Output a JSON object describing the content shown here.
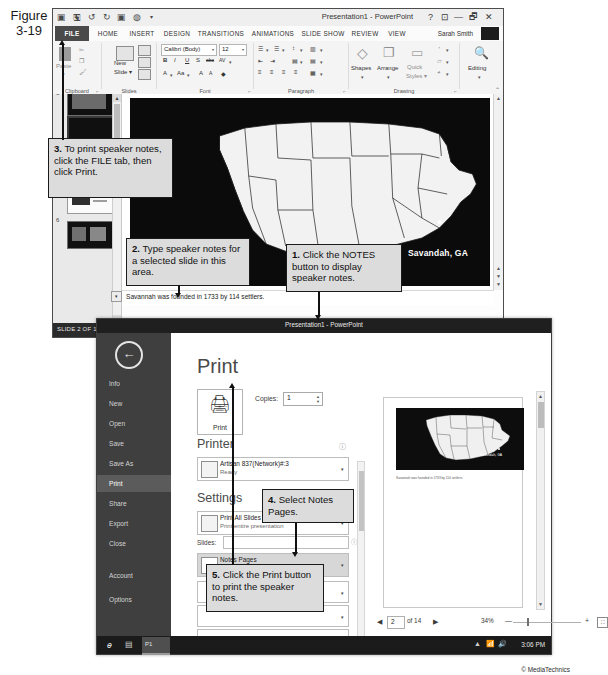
{
  "figure": {
    "line1": "Figure",
    "line2": "3-19"
  },
  "copyright": "© MediaTechnics",
  "ppt_window": {
    "title": "Presentation1 - PowerPoint",
    "quick_access": [
      "save-icon",
      "undo-icon",
      "redo-icon",
      "start-slideshow-icon",
      "customize-icon"
    ],
    "window_buttons": [
      "?",
      "⊡",
      "—",
      "🗗",
      "✕"
    ],
    "tabs": [
      "FILE",
      "HOME",
      "INSERT",
      "DESIGN",
      "TRANSITIONS",
      "ANIMATIONS",
      "SLIDE SHOW",
      "REVIEW",
      "VIEW"
    ],
    "user": "Sarah Smith",
    "ribbon_groups": [
      "Clipboard",
      "Slides",
      "Font",
      "Paragraph",
      "Drawing",
      "Editing"
    ],
    "ribbon": {
      "paste_label": "Paste",
      "new_slide_label": "New\nSlide",
      "font_name": "Calibri (Body)",
      "font_size": "12",
      "bold": "B",
      "italic": "I",
      "underline": "U",
      "shadow": "S",
      "strike": "abc",
      "char_spacing": "AV",
      "font_color": "A",
      "change_case": "Aa",
      "grow_font": "A",
      "shrink_font": "A",
      "clear_format": "◆",
      "shapes_label": "Shapes",
      "arrange_label": "Arrange",
      "quick_styles_label": "Quick\nStyles",
      "editing_label": "Editing"
    },
    "thumbnails": [
      {
        "number": "3",
        "selected": false
      },
      {
        "number": "4",
        "selected": false
      },
      {
        "number": "5",
        "selected": false
      },
      {
        "number": "6",
        "selected": false
      }
    ],
    "slide": {
      "caption": "Savandah, GA"
    },
    "notes": "Savannah was founded in 1733 by 114 settlers.",
    "status": {
      "slide_count": "SLIDE 2 OF 14",
      "language_icon": "language-icon",
      "notes_button": "NOTES",
      "comments_button": "COMMENTS",
      "zoom_percent": "48%",
      "view_buttons": [
        "normal-view-icon",
        "slide-sorter-icon",
        "reading-view-icon",
        "slideshow-icon"
      ]
    }
  },
  "print_window": {
    "title": "Presentation1 - PowerPoint",
    "window_buttons": [
      "?",
      "—",
      "🗗",
      "✕"
    ],
    "user": "Sarah Smith",
    "back_icon": "back-arrow-icon",
    "nav_items": [
      {
        "label": "Info",
        "active": false
      },
      {
        "label": "New",
        "active": false
      },
      {
        "label": "Open",
        "active": false
      },
      {
        "label": "Save",
        "active": false
      },
      {
        "label": "Save As",
        "active": false
      },
      {
        "label": "Print",
        "active": true
      },
      {
        "label": "Share",
        "active": false
      },
      {
        "label": "Export",
        "active": false
      },
      {
        "label": "Close",
        "active": false
      },
      {
        "label": "Account",
        "active": false
      },
      {
        "label": "Options",
        "active": false
      }
    ],
    "heading": "Print",
    "print_button_label": "Print",
    "copies_label": "Copies:",
    "copies_value": "1",
    "printer_heading": "Printer",
    "printer_name": "Artisan 837(Network)#:3",
    "printer_status": "Ready",
    "settings_heading": "Settings",
    "settings": [
      {
        "title": "Print All Slides",
        "subtitle": "Print entire presentation",
        "highlighted": false
      },
      {
        "title": "Notes Pages",
        "subtitle": "Print slides with notes",
        "highlighted": true
      }
    ],
    "slides_label": "Slides:",
    "slides_value": "",
    "preview": {
      "notes_caption": "Savannah was founded in 1733 by 114 settlers.",
      "page_current": "2",
      "page_of": "of 14",
      "zoom_percent": "34%",
      "prev_icon": "previous-page-icon",
      "next_icon": "next-page-icon",
      "fit_icon": "zoom-to-page-icon"
    },
    "taskbar": {
      "ie_icon": "internet-explorer-icon",
      "explorer_icon": "file-explorer-icon",
      "active_app": "P1",
      "clock": "3:06 PM",
      "tray": [
        "show-hidden-icon",
        "network-icon",
        "volume-icon"
      ]
    }
  },
  "callouts": [
    {
      "id": "callout-1",
      "number": "1.",
      "text": " Click the NOTES button to display speaker notes."
    },
    {
      "id": "callout-2",
      "number": "2.",
      "text": " Type speaker notes for a selected slide in this area."
    },
    {
      "id": "callout-3",
      "number": "3.",
      "text": " To print speaker notes, click the FILE tab, then click Print."
    },
    {
      "id": "callout-4",
      "number": "4.",
      "text": " Select Notes Pages."
    },
    {
      "id": "callout-5",
      "number": "5.",
      "text": " Click the Print button to print the speaker notes."
    }
  ]
}
